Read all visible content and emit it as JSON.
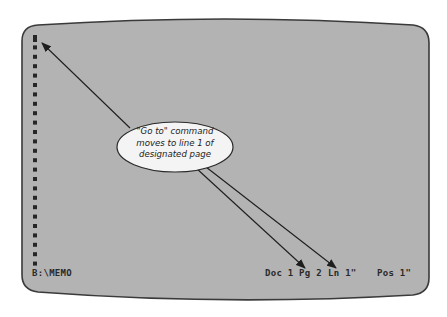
{
  "screen": {
    "background_color": "#b3b3b3",
    "border_color": "#3a3a3a",
    "marker_color": "#262626",
    "marker_count": 25
  },
  "status_bar": {
    "filename": "B:\\MEMO",
    "doc": "Doc 1",
    "page": "Pg 2",
    "line": "Ln 1\"",
    "position": "Pos 1\""
  },
  "callout": {
    "lines": [
      "\"Go to\" command",
      "moves to line 1 of",
      "designated page"
    ],
    "fill_color": "#f4f4f4"
  }
}
